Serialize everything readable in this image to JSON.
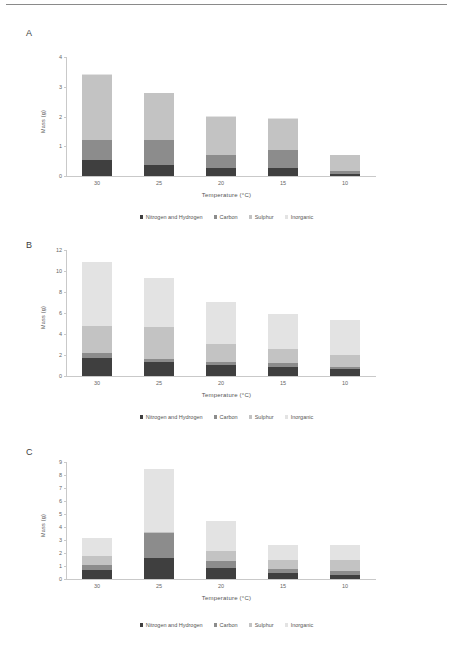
{
  "figure": {
    "panels": [
      "A",
      "B",
      "C"
    ],
    "series_names": [
      "Nitrogen and Hydrogen",
      "Carbon",
      "Sulphur",
      "Inorganic"
    ],
    "series_colors": [
      "#3f3f3f",
      "#8c8c8c",
      "#c3c3c3",
      "#e3e3e3"
    ],
    "xlabel": "Temperature (°C)",
    "ylabel": "Mass (g)",
    "categories": [
      "30",
      "25",
      "20",
      "15",
      "10"
    ]
  },
  "chart_data": [
    {
      "type": "bar",
      "panel": "A",
      "title": "A",
      "stacked": true,
      "categories": [
        "30",
        "25",
        "20",
        "15",
        "10"
      ],
      "series": [
        {
          "name": "Nitrogen and Hydrogen",
          "color": "#3f3f3f",
          "values": [
            0.55,
            0.38,
            0.27,
            0.26,
            0.08
          ]
        },
        {
          "name": "Carbon",
          "color": "#8c8c8c",
          "values": [
            0.66,
            0.82,
            0.43,
            0.6,
            0.09
          ]
        },
        {
          "name": "Sulphur",
          "color": "#c3c3c3",
          "values": [
            2.2,
            1.58,
            1.3,
            1.07,
            0.54
          ]
        },
        {
          "name": "Inorganic",
          "color": "#e3e3e3",
          "values": [
            0.02,
            0.02,
            0.01,
            0.01,
            0.01
          ]
        }
      ],
      "totals": [
        3.43,
        2.8,
        2.01,
        1.94,
        0.72
      ],
      "xlabel": "Temperature (°C)",
      "ylabel": "Mass (g)",
      "ylim": [
        0,
        4
      ],
      "yticks": [
        "0",
        "1",
        "2",
        "3",
        "4"
      ],
      "grid": false,
      "legend_position": "bottom"
    },
    {
      "type": "bar",
      "panel": "B",
      "title": "B",
      "stacked": true,
      "categories": [
        "30",
        "25",
        "20",
        "15",
        "10"
      ],
      "series": [
        {
          "name": "Nitrogen and Hydrogen",
          "color": "#3f3f3f",
          "values": [
            1.7,
            1.3,
            1.05,
            0.9,
            0.7
          ]
        },
        {
          "name": "Carbon",
          "color": "#8c8c8c",
          "values": [
            0.45,
            0.3,
            0.25,
            0.35,
            0.2
          ]
        },
        {
          "name": "Sulphur",
          "color": "#c3c3c3",
          "values": [
            2.6,
            3.1,
            1.75,
            1.3,
            1.15
          ]
        },
        {
          "name": "Inorganic",
          "color": "#e3e3e3",
          "values": [
            6.15,
            4.6,
            4.0,
            3.4,
            3.3
          ]
        }
      ],
      "totals": [
        10.9,
        9.3,
        7.05,
        5.95,
        5.35
      ],
      "xlabel": "Temperature (°C)",
      "ylabel": "Mass (g)",
      "ylim": [
        0,
        12
      ],
      "yticks": [
        "0",
        "2",
        "4",
        "6",
        "8",
        "10",
        "12"
      ],
      "grid": false,
      "legend_position": "bottom"
    },
    {
      "type": "bar",
      "panel": "C",
      "title": "C",
      "stacked": true,
      "categories": [
        "30",
        "25",
        "20",
        "15",
        "10"
      ],
      "series": [
        {
          "name": "Nitrogen and Hydrogen",
          "color": "#3f3f3f",
          "values": [
            0.7,
            1.65,
            0.85,
            0.45,
            0.3
          ]
        },
        {
          "name": "Carbon",
          "color": "#8c8c8c",
          "values": [
            0.35,
            1.9,
            0.55,
            0.35,
            0.35
          ]
        },
        {
          "name": "Sulphur",
          "color": "#c3c3c3",
          "values": [
            0.7,
            0.05,
            0.75,
            0.65,
            0.85
          ]
        },
        {
          "name": "Inorganic",
          "color": "#e3e3e3",
          "values": [
            1.4,
            4.9,
            2.35,
            1.15,
            1.1
          ]
        }
      ],
      "totals": [
        3.15,
        8.5,
        4.5,
        2.6,
        2.6
      ],
      "xlabel": "Temperature (°C)",
      "ylabel": "Mass (g)",
      "ylim": [
        0,
        9
      ],
      "yticks": [
        "0",
        "1",
        "2",
        "3",
        "4",
        "5",
        "6",
        "7",
        "8",
        "9"
      ],
      "grid": false,
      "legend_position": "bottom"
    }
  ]
}
